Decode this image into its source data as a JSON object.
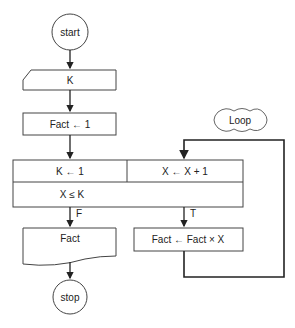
{
  "diagram": {
    "type": "flowchart",
    "nodes": {
      "start": {
        "label": "start",
        "shape": "terminal-circle"
      },
      "input_k": {
        "label": "K",
        "shape": "manual-input"
      },
      "init_fact": {
        "label": "Fact ← 1",
        "shape": "process"
      },
      "loop_init": {
        "label": "K ← 1",
        "shape": "loop-init"
      },
      "loop_step": {
        "label": "X ← X + 1",
        "shape": "loop-step"
      },
      "loop_cond": {
        "label": "X ≤ K",
        "shape": "loop-condition"
      },
      "output_fact": {
        "label": "Fact",
        "shape": "document"
      },
      "body": {
        "label": "Fact ← Fact × X",
        "shape": "process"
      },
      "stop": {
        "label": "stop",
        "shape": "terminal-circle"
      },
      "loop_annotation": {
        "label": "Loop",
        "shape": "cloud"
      }
    },
    "edge_labels": {
      "false": "F",
      "true": "T"
    },
    "colors": {
      "stroke": "#333333",
      "text": "#222222",
      "background": "#ffffff"
    }
  }
}
